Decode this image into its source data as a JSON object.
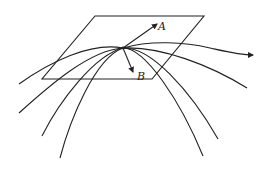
{
  "diagram": {
    "labels": {
      "vector_a": "A",
      "vector_b": "B"
    },
    "curve_count": 4,
    "colors": {
      "stroke": "#222222",
      "background": "#ffffff"
    }
  }
}
